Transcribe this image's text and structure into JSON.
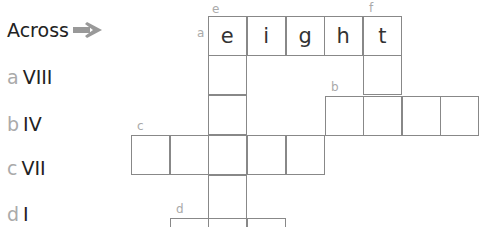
{
  "heading": "Across",
  "clues": [
    {
      "letter": "a",
      "text": "VIII"
    },
    {
      "letter": "b",
      "text": "IV"
    },
    {
      "letter": "c",
      "text": "VII"
    },
    {
      "letter": "d",
      "text": "I"
    }
  ],
  "grid_labels": {
    "a": "a",
    "b": "b",
    "c": "c",
    "d": "d",
    "e": "e",
    "f": "f"
  },
  "answer_a": [
    "e",
    "i",
    "g",
    "h",
    "t"
  ],
  "colors": {
    "clue_letter": "#aaaaaa",
    "text": "#222222",
    "grid_line": "#888888",
    "arrow": "#999999"
  }
}
